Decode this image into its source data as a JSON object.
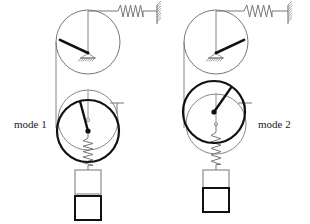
{
  "figure": {
    "title": "",
    "type": "mechanical-vibration-mode-shapes",
    "background_color": "#ffffff",
    "thin_line_color": "#777777",
    "thick_line_color": "#111111",
    "label_color": "#1a1a1a"
  },
  "labels": {
    "mode1": "mode 1",
    "mode2": "mode 2"
  },
  "modes": [
    {
      "id": "mode-1",
      "label": "mode 1",
      "label_x": 14,
      "label_y": 128,
      "upper_pulley": {
        "cx": 88,
        "cy": 42,
        "r": 32,
        "pivot_x": 88,
        "pivot_y": 53,
        "spoke_angle_deg": 205,
        "spoke_length": 31,
        "top_contact_x": 88,
        "top_contact_y": 11,
        "left_contact_x": 56,
        "left_contact_y": 42
      },
      "spring_top": {
        "x1": 88,
        "y1": 11,
        "x2": 157,
        "y2": 11,
        "coil_start": 118,
        "coil_end": 143,
        "coils": 5,
        "amp": 6
      },
      "wall_top": {
        "x": 157,
        "y_top": 5,
        "y_bottom": 24,
        "hatch_side": "right"
      },
      "cord": {
        "x": 56,
        "y1": 42,
        "y2": 128
      },
      "lower_pulley_ref": {
        "cx": 88,
        "cy": 120,
        "r": 30
      },
      "lower_pulley_mode": {
        "cx": 88,
        "cy": 131,
        "r": 31,
        "hub_x": 88,
        "hub_y": 131,
        "spoke_angle_deg": 255,
        "spoke_length": 30
      },
      "tick_marker": {
        "x": 117,
        "y": 103,
        "arm": 7,
        "stem": 11
      },
      "spring_bottom": {
        "x": 88,
        "y1": 131,
        "y2": 170,
        "coil_start": 138,
        "coil_end": 166,
        "coils": 5,
        "amp": 5
      },
      "block_ref": {
        "x": 75,
        "y": 170,
        "w": 26,
        "h": 24
      },
      "block_mode": {
        "x": 75,
        "y": 196,
        "w": 26,
        "h": 24
      }
    },
    {
      "id": "mode-2",
      "label": "mode 2",
      "label_x": 258,
      "label_y": 128,
      "upper_pulley": {
        "cx": 216,
        "cy": 42,
        "r": 32,
        "pivot_x": 216,
        "pivot_y": 53,
        "spoke_angle_deg": 335,
        "spoke_length": 31,
        "top_contact_x": 216,
        "top_contact_y": 11,
        "left_contact_x": 184,
        "left_contact_y": 42
      },
      "spring_top": {
        "x1": 216,
        "y1": 11,
        "x2": 288,
        "y2": 11,
        "coil_start": 244,
        "coil_end": 272,
        "coils": 5,
        "amp": 6
      },
      "wall_top": {
        "x": 288,
        "y_top": 5,
        "y_bottom": 24,
        "hatch_side": "right"
      },
      "cord": {
        "x": 184,
        "y1": 42,
        "y2": 128
      },
      "lower_pulley_ref": {
        "cx": 216,
        "cy": 124,
        "r": 30
      },
      "lower_pulley_mode": {
        "cx": 214,
        "cy": 112,
        "r": 31,
        "hub_x": 214,
        "hub_y": 112,
        "spoke_angle_deg": 305,
        "spoke_length": 30
      },
      "tick_marker": {
        "x": 245,
        "y": 103,
        "arm": 7,
        "stem": 11
      },
      "spring_bottom": {
        "x": 216,
        "y1": 124,
        "y2": 170,
        "coil_start": 138,
        "coil_end": 166,
        "coils": 5,
        "amp": 5
      },
      "block_ref": {
        "x": 203,
        "y": 170,
        "w": 26,
        "h": 24
      },
      "block_mode": {
        "x": 203,
        "y": 188,
        "w": 26,
        "h": 24
      }
    }
  ]
}
